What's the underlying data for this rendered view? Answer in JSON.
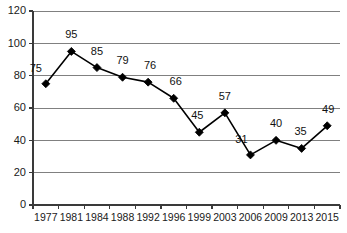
{
  "chart_data": {
    "type": "line",
    "title": "",
    "subtitle": "",
    "xlabel": "",
    "ylabel": "",
    "categories": [
      "1977",
      "1981",
      "1984",
      "1988",
      "1992",
      "1996",
      "1999",
      "2003",
      "2006",
      "2009",
      "2013",
      "2015"
    ],
    "values": [
      75,
      95,
      85,
      79,
      76,
      66,
      45,
      57,
      31,
      40,
      35,
      49
    ],
    "point_labels": [
      "75",
      "95",
      "85",
      "79",
      "76",
      "66",
      "45",
      "57",
      "31",
      "40",
      "35",
      "49"
    ],
    "ylim": [
      0,
      120
    ],
    "ytick_values": [
      0,
      20,
      40,
      60,
      80,
      100,
      120
    ],
    "ytick_labels": [
      "0",
      "20",
      "40",
      "60",
      "80",
      "100",
      "120"
    ],
    "grid": true,
    "grid_axis": "y",
    "legend": false,
    "legend_position": "none",
    "series": [
      {
        "name": "",
        "values": [
          75,
          95,
          85,
          79,
          76,
          66,
          45,
          57,
          31,
          40,
          35,
          49
        ],
        "marker": "diamond",
        "line_color": "#000000",
        "marker_color": "#000000"
      }
    ],
    "colors": {
      "line": "#000000",
      "marker": "#000000",
      "grid": "#808080",
      "axis": "#3a3a3a",
      "label_text": "#111111",
      "tick_text": "#1a1a1a",
      "background": "#ffffff"
    },
    "label_offsets": [
      {
        "dx": -10,
        "dy": -12
      },
      {
        "dx": 0,
        "dy": -13
      },
      {
        "dx": 0,
        "dy": -13
      },
      {
        "dx": 0,
        "dy": -13
      },
      {
        "dx": 2,
        "dy": -13
      },
      {
        "dx": 2,
        "dy": -13
      },
      {
        "dx": -2,
        "dy": -13
      },
      {
        "dx": 0,
        "dy": -13
      },
      {
        "dx": -9,
        "dy": -12
      },
      {
        "dx": 0,
        "dy": -13
      },
      {
        "dx": -1,
        "dy": -13
      },
      {
        "dx": 1,
        "dy": -13
      }
    ]
  }
}
